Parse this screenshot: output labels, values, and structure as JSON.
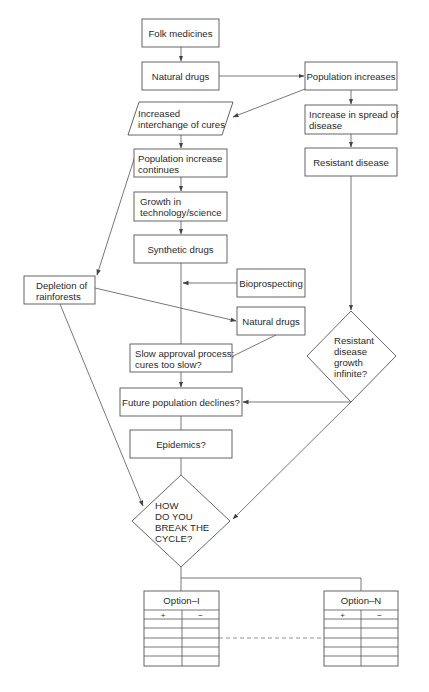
{
  "diagram": {
    "nodes": {
      "folk_medicines": {
        "label": "Folk medicines"
      },
      "natural_drugs_1": {
        "label": "Natural drugs"
      },
      "population_increases": {
        "label": "Population increases"
      },
      "increased_interchange": {
        "lines": [
          "Increased",
          "interchange of cures"
        ]
      },
      "increase_spread": {
        "lines": [
          "Increase in spread of",
          "disease"
        ]
      },
      "resistant_disease": {
        "label": "Resistant disease"
      },
      "population_continues": {
        "lines": [
          "Population increase",
          "continues"
        ]
      },
      "growth_technology": {
        "lines": [
          "Growth in",
          "technology/science"
        ]
      },
      "synthetic_drugs": {
        "label": "Synthetic drugs"
      },
      "bioprospecting": {
        "label": "Bioprospecting"
      },
      "depletion_rainforests": {
        "lines": [
          "Depletion of",
          "rainforests"
        ]
      },
      "natural_drugs_2": {
        "label": "Natural drugs"
      },
      "slow_approval": {
        "lines": [
          "Slow approval process;",
          "cures too slow?"
        ]
      },
      "resistant_growth": {
        "lines": [
          "Resistant",
          "disease",
          "growth",
          "infinite?"
        ]
      },
      "future_population": {
        "label": "Future population declines?"
      },
      "epidemics": {
        "label": "Epidemics?"
      },
      "break_cycle": {
        "lines": [
          "HOW",
          "DO YOU",
          "BREAK THE",
          "CYCLE?"
        ]
      }
    },
    "options": [
      {
        "title": "Option–I",
        "plus": "+",
        "minus": "−"
      },
      {
        "title": "Option–N",
        "plus": "+",
        "minus": "−"
      }
    ],
    "colors": {
      "stroke": "#555555",
      "text": "#2a2a2a",
      "background": "#ffffff"
    }
  }
}
